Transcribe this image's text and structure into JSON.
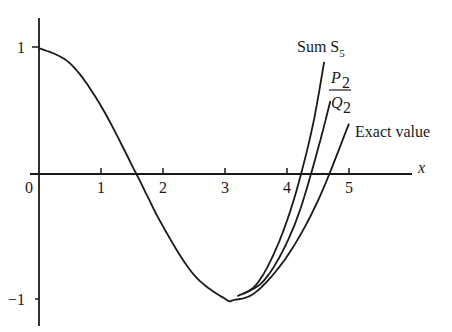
{
  "chart_data": {
    "type": "line",
    "title": "",
    "xlabel": "x",
    "ylabel": "",
    "xlim": [
      0,
      5.6
    ],
    "ylim": [
      -1.2,
      1.25
    ],
    "x_ticks": [
      "0",
      "1",
      "2",
      "3",
      "4",
      "5"
    ],
    "y_ticks": [
      "1",
      "−1"
    ],
    "grid": false,
    "legend_position": "inline-labels",
    "series": [
      {
        "name": "Sum S5",
        "label_main": "Sum S",
        "label_sub": "5",
        "x": [
          3.2,
          3.5,
          3.8,
          4.1,
          4.4,
          4.6
        ],
        "values": [
          -0.97,
          -0.88,
          -0.62,
          -0.22,
          0.35,
          0.89
        ]
      },
      {
        "name": "P2/Q2",
        "label_num": "P",
        "label_den": "Q",
        "label_sub": "2",
        "x": [
          3.3,
          3.6,
          3.9,
          4.2,
          4.5,
          4.7
        ],
        "values": [
          -0.95,
          -0.86,
          -0.64,
          -0.3,
          0.2,
          0.58
        ]
      },
      {
        "name": "Exact value",
        "label": "Exact value",
        "x": [
          0,
          0.5,
          1.0,
          1.5708,
          2.0,
          2.5,
          3.0,
          3.1416,
          3.5,
          4.0,
          4.5,
          5.0
        ],
        "values": [
          1.0,
          0.878,
          0.54,
          0.0,
          -0.416,
          -0.801,
          -0.99,
          -1.0,
          -0.936,
          -0.654,
          -0.211,
          0.4
        ]
      }
    ],
    "annotations": [
      "Sum S5",
      "P2/Q2",
      "Exact value"
    ]
  }
}
